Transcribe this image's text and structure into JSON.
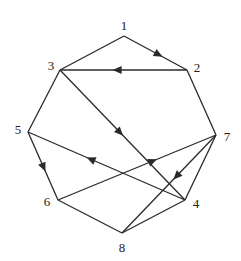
{
  "diagram": {
    "type": "directed-graph",
    "colors": {
      "stroke": "#2a2a2a",
      "background": "#ffffff",
      "label": "#222222"
    },
    "nodes": [
      {
        "id": "1",
        "label": "1",
        "x": 124,
        "y": 36,
        "lx": 124,
        "ly": 25
      },
      {
        "id": "2",
        "label": "2",
        "x": 187,
        "y": 70,
        "lx": 197,
        "ly": 67
      },
      {
        "id": "3",
        "label": "3",
        "x": 60,
        "y": 70,
        "lx": 51,
        "ly": 65
      },
      {
        "id": "4",
        "label": "4",
        "x": 185,
        "y": 200,
        "lx": 196,
        "ly": 203
      },
      {
        "id": "5",
        "label": "5",
        "x": 28,
        "y": 132,
        "lx": 18,
        "ly": 129
      },
      {
        "id": "6",
        "label": "6",
        "x": 58,
        "y": 200,
        "lx": 47,
        "ly": 201
      },
      {
        "id": "7",
        "label": "7",
        "x": 216,
        "y": 135,
        "lx": 227,
        "ly": 136
      },
      {
        "id": "8",
        "label": "8",
        "x": 122,
        "y": 233,
        "lx": 122,
        "ly": 247
      }
    ],
    "edges": [
      {
        "from": "1",
        "to": "3",
        "arrow": false
      },
      {
        "from": "1",
        "to": "2",
        "arrow": true,
        "arrow_pos": 0.55
      },
      {
        "from": "2",
        "to": "3",
        "arrow": true,
        "arrow_pos": 0.55
      },
      {
        "from": "3",
        "to": "5",
        "arrow": false
      },
      {
        "from": "3",
        "to": "4",
        "arrow": true,
        "arrow_pos": 0.48
      },
      {
        "from": "2",
        "to": "7",
        "arrow": false
      },
      {
        "from": "5",
        "to": "6",
        "arrow": true,
        "arrow_pos": 0.52
      },
      {
        "from": "4",
        "to": "5",
        "arrow": true,
        "arrow_pos": 0.6
      },
      {
        "from": "6",
        "to": "7",
        "arrow": true,
        "arrow_pos": 0.6
      },
      {
        "from": "6",
        "to": "8",
        "arrow": false
      },
      {
        "from": "7",
        "to": "4",
        "arrow": false
      },
      {
        "from": "7",
        "to": "8",
        "arrow": true,
        "arrow_pos": 0.42
      },
      {
        "from": "4",
        "to": "8",
        "arrow": false
      }
    ]
  }
}
